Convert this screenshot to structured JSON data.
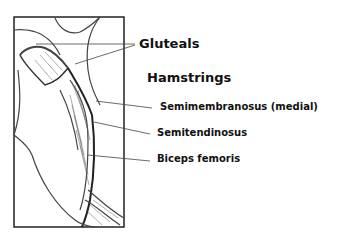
{
  "diagram": {
    "title": "Hamstrings",
    "labels": {
      "gluteals": "Gluteals",
      "hamstrings": "Hamstrings",
      "semimembranosus": "Semimembranosus (medial)",
      "semitendinosus": "Semitendinosus",
      "biceps_femoris": "Biceps femoris"
    },
    "colors": {
      "line": "#333333",
      "text": "#111111",
      "shading": "#555555"
    }
  }
}
